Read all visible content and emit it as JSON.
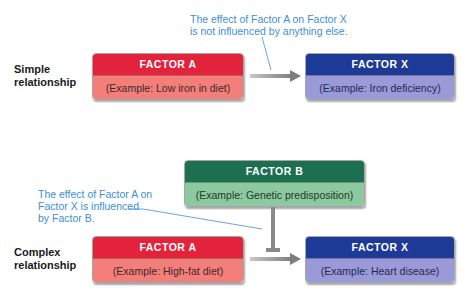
{
  "clipped_top_text": "Section Relationships between factors and outcomes",
  "simple": {
    "label_line1": "Simple",
    "label_line2": "relationship",
    "callout_line1": "The effect of Factor A on Factor X",
    "callout_line2": "is not influenced by anything else.",
    "factor_a": {
      "title": "FACTOR  A",
      "example": "(Example: Low iron in diet)"
    },
    "factor_x": {
      "title": "FACTOR  X",
      "example": "(Example: Iron deficiency)"
    }
  },
  "complex": {
    "label_line1": "Complex",
    "label_line2": "relationship",
    "callout_line1": "The effect of Factor A on",
    "callout_line2": "Factor X is influenced",
    "callout_line3": "by Factor B.",
    "factor_b": {
      "title": "FACTOR  B",
      "example": "(Example: Genetic predisposition)"
    },
    "factor_a": {
      "title": "FACTOR  A",
      "example": "(Example: High-fat diet)"
    },
    "factor_x": {
      "title": "FACTOR  X",
      "example": "(Example: Heart disease)"
    }
  },
  "colors": {
    "factor_a": "#e3223b",
    "factor_x": "#1e3a97",
    "factor_b": "#1c7050",
    "callout_text": "#3d8fd4",
    "arrow": "#8a8a8a"
  }
}
